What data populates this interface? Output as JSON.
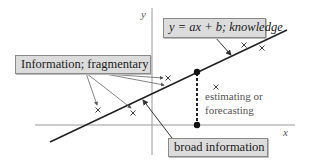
{
  "diagram": {
    "axes": {
      "x_label": "x",
      "y_label": "y"
    },
    "boxes": {
      "knowledge": {
        "text": "y = ax + b; knowledge"
      },
      "fragmentary": {
        "text": "Information; fragmentary"
      },
      "broad": {
        "text": "broad information"
      }
    },
    "annotation": {
      "line1": "estimating or",
      "line2": "forecasting"
    },
    "colors": {
      "box_fill": "#dcdcdc",
      "box_border": "#8a8a8a",
      "line": "#222222",
      "axis": "#999999"
    },
    "points": [
      {
        "x": 98,
        "y": 110
      },
      {
        "x": 133,
        "y": 113
      },
      {
        "x": 168,
        "y": 78
      },
      {
        "x": 216,
        "y": 87
      },
      {
        "x": 244,
        "y": 45
      },
      {
        "x": 262,
        "y": 48
      }
    ]
  }
}
